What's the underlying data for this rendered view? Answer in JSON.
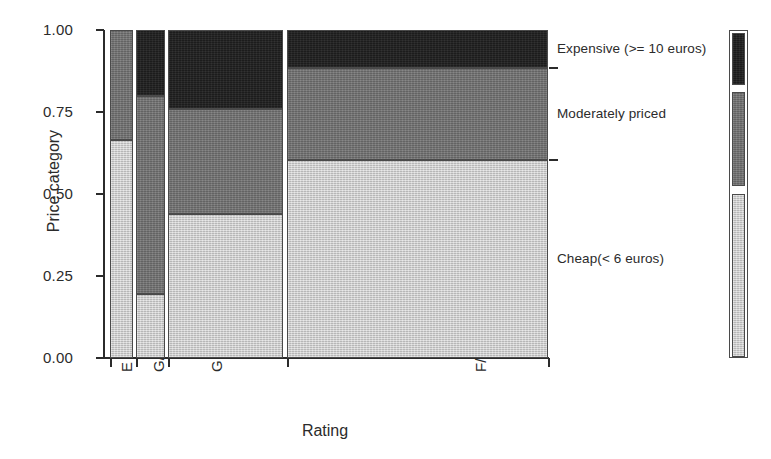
{
  "figure": {
    "type": "mosaic-plot",
    "x_axis_title": "Rating",
    "y_axis_title": "Price category"
  },
  "axes": {
    "y_ticks": [
      "1.00",
      "0.75",
      "0.50",
      "0.25",
      "0.00"
    ],
    "y_tick_values": [
      1.0,
      0.75,
      0.5,
      0.25,
      0.0
    ],
    "x_categories": [
      "E",
      "G/E",
      "G",
      "F/G"
    ]
  },
  "legend": {
    "items": [
      {
        "label": "Expensive (>= 10 euros)",
        "color": "#1c1c1c",
        "key": "expensive"
      },
      {
        "label": "Moderately priced",
        "color": "#6f6f6f",
        "key": "moderate"
      },
      {
        "label": "Cheap(< 6 euros)",
        "color": "#c9c9c9",
        "key": "cheap"
      }
    ]
  },
  "chart_data": {
    "type": "bar",
    "subtype": "mosaic",
    "title": "",
    "xlabel": "Rating",
    "ylabel": "Price category",
    "ylim": [
      0,
      1
    ],
    "grid": false,
    "legend_position": "right",
    "categories": [
      "E",
      "G/E",
      "G",
      "F/G"
    ],
    "column_widths": [
      0.053,
      0.066,
      0.263,
      0.596
    ],
    "series": [
      {
        "name": "Expensive (>= 10 euros)",
        "color": "#1c1c1c",
        "values": [
          0.0,
          0.2,
          0.24,
          0.115
        ]
      },
      {
        "name": "Moderately priced",
        "color": "#6f6f6f",
        "values": [
          0.335,
          0.605,
          0.32,
          0.28
        ]
      },
      {
        "name": "Cheap(< 6 euros)",
        "color": "#c9c9c9",
        "values": [
          0.665,
          0.195,
          0.44,
          0.605
        ]
      }
    ],
    "columns": [
      {
        "category": "E",
        "x0": 0.0,
        "x1": 0.053,
        "tiles": [
          {
            "series": "Expensive (>= 10 euros)",
            "y0": 1.0,
            "y1": 1.0,
            "height": 0.0
          },
          {
            "series": "Moderately priced",
            "y0": 1.0,
            "y1": 0.665,
            "height": 0.335
          },
          {
            "series": "Cheap(< 6 euros)",
            "y0": 0.665,
            "y1": 0.0,
            "height": 0.665
          }
        ]
      },
      {
        "category": "G/E",
        "x0": 0.06,
        "x1": 0.126,
        "tiles": [
          {
            "series": "Expensive (>= 10 euros)",
            "y0": 1.0,
            "y1": 0.8,
            "height": 0.2
          },
          {
            "series": "Moderately priced",
            "y0": 0.8,
            "y1": 0.195,
            "height": 0.605
          },
          {
            "series": "Cheap(< 6 euros)",
            "y0": 0.195,
            "y1": 0.0,
            "height": 0.195
          }
        ]
      },
      {
        "category": "G",
        "x0": 0.132,
        "x1": 0.395,
        "tiles": [
          {
            "series": "Expensive (>= 10 euros)",
            "y0": 1.0,
            "y1": 0.76,
            "height": 0.24
          },
          {
            "series": "Moderately priced",
            "y0": 0.76,
            "y1": 0.44,
            "height": 0.32
          },
          {
            "series": "Cheap(< 6 euros)",
            "y0": 0.44,
            "y1": 0.0,
            "height": 0.44
          }
        ]
      },
      {
        "category": "F/G",
        "x0": 0.404,
        "x1": 1.0,
        "tiles": [
          {
            "series": "Expensive (>= 10 euros)",
            "y0": 1.0,
            "y1": 0.885,
            "height": 0.115
          },
          {
            "series": "Moderately priced",
            "y0": 0.885,
            "y1": 0.605,
            "height": 0.28
          },
          {
            "series": "Cheap(< 6 euros)",
            "y0": 0.605,
            "y1": 0.0,
            "height": 0.605
          }
        ]
      }
    ],
    "right_axis_ticks": [
      0.885,
      0.605
    ]
  }
}
